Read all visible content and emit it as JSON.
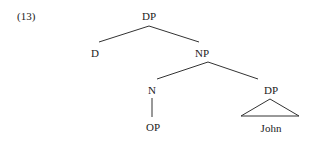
{
  "example_number": "(13)",
  "tree": {
    "root": {
      "label": "DP"
    },
    "d": {
      "label": "D"
    },
    "np": {
      "label": "NP"
    },
    "n": {
      "label": "N"
    },
    "op": {
      "label": "OP"
    },
    "dp2": {
      "label": "DP"
    },
    "john": {
      "label": "John"
    }
  },
  "colors": {
    "line": "#333333",
    "text": "#222222",
    "background": "#ffffff"
  }
}
